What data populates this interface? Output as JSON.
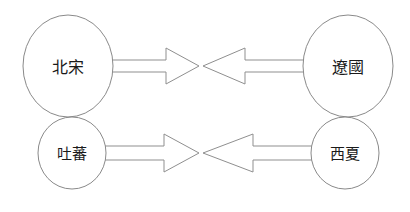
{
  "diagram": {
    "type": "relationship-diagram",
    "background_color": "#ffffff",
    "stroke_color": "#8a8a8a",
    "text_color": "#1a1a1a",
    "nodes": [
      {
        "id": "beisong",
        "label": "北宋",
        "position": "top-left",
        "shape": "ellipse",
        "cx": 68,
        "cy": 66,
        "rx": 45,
        "ry": 51
      },
      {
        "id": "liaoguo",
        "label": "遼國",
        "position": "top-right",
        "shape": "ellipse",
        "cx": 348,
        "cy": 66,
        "rx": 45,
        "ry": 51
      },
      {
        "id": "tubo",
        "label": "吐蕃",
        "position": "bottom-left",
        "shape": "ellipse",
        "cx": 72,
        "cy": 153,
        "rx": 34,
        "ry": 36
      },
      {
        "id": "xixia",
        "label": "西夏",
        "position": "bottom-right",
        "shape": "ellipse",
        "cx": 345,
        "cy": 153,
        "rx": 34,
        "ry": 36
      }
    ],
    "arrows": [
      {
        "id": "beisong-to-liaoguo",
        "from": "beisong",
        "to": "liaoguo",
        "direction": "right",
        "row": "top"
      },
      {
        "id": "liaoguo-to-beisong",
        "from": "liaoguo",
        "to": "beisong",
        "direction": "left",
        "row": "top"
      },
      {
        "id": "tubo-to-xixia",
        "from": "tubo",
        "to": "xixia",
        "direction": "right",
        "row": "bottom"
      },
      {
        "id": "xixia-to-tubo",
        "from": "xixia",
        "to": "tubo",
        "direction": "left",
        "row": "bottom"
      }
    ]
  }
}
